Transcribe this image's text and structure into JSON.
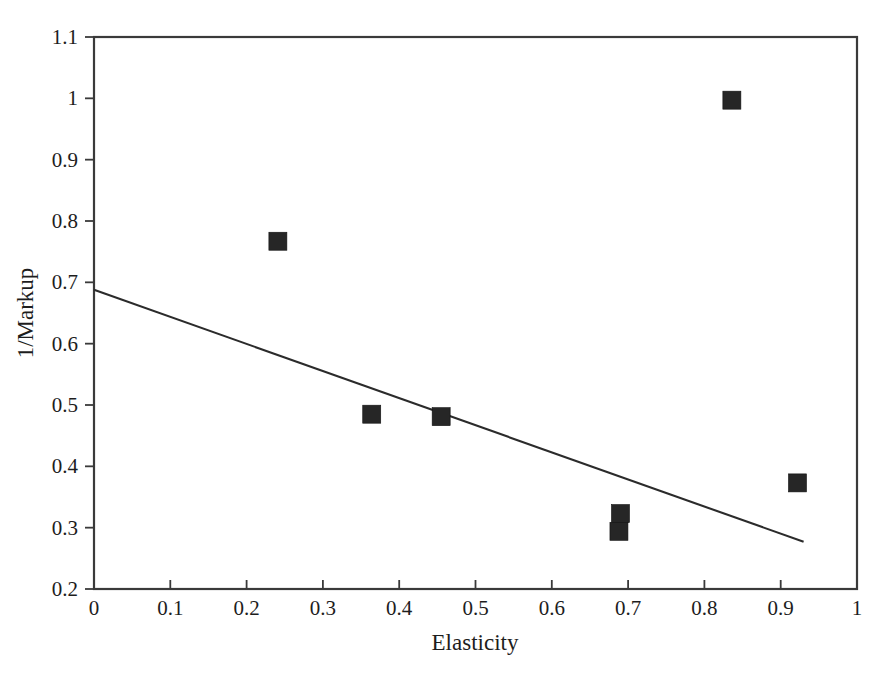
{
  "chart_data": {
    "type": "scatter",
    "title": "",
    "xlabel": "Elasticity",
    "ylabel": "1/Markup",
    "xlim": [
      0,
      1
    ],
    "ylim": [
      0.2,
      1.1
    ],
    "grid": false,
    "legend": "none",
    "xticks": [
      "0",
      "0.1",
      "0.2",
      "0.3",
      "0.4",
      "0.5",
      "0.6",
      "0.7",
      "0.8",
      "0.9",
      "1"
    ],
    "xtick_values": [
      0,
      0.1,
      0.2,
      0.3,
      0.4,
      0.5,
      0.6,
      0.7,
      0.8,
      0.9,
      1
    ],
    "yticks": [
      "0.2",
      "0.3",
      "0.4",
      "0.5",
      "0.6",
      "0.7",
      "0.8",
      "0.9",
      "1",
      "1.1"
    ],
    "ytick_values": [
      0.2,
      0.3,
      0.4,
      0.5,
      0.6,
      0.7,
      0.8,
      0.9,
      1.0,
      1.1
    ],
    "marker_style": "filled-square",
    "marker_color": "#262626",
    "points": [
      {
        "x": 0.241,
        "y": 0.767
      },
      {
        "x": 0.364,
        "y": 0.485
      },
      {
        "x": 0.455,
        "y": 0.481
      },
      {
        "x": 0.69,
        "y": 0.323
      },
      {
        "x": 0.688,
        "y": 0.294
      },
      {
        "x": 0.836,
        "y": 0.997
      },
      {
        "x": 0.922,
        "y": 0.373
      }
    ],
    "series": [
      {
        "name": "observations",
        "x": [
          0.241,
          0.364,
          0.455,
          0.69,
          0.688,
          0.836,
          0.922
        ],
        "values": [
          0.767,
          0.485,
          0.481,
          0.323,
          0.294,
          0.997,
          0.373
        ]
      }
    ],
    "trend_line": {
      "type": "line",
      "color": "#2b2b2b",
      "x": [
        0.0,
        0.93
      ],
      "values": [
        0.688,
        0.277
      ]
    }
  },
  "axes": {
    "x_title": "Elasticity",
    "y_title": "1/Markup"
  }
}
